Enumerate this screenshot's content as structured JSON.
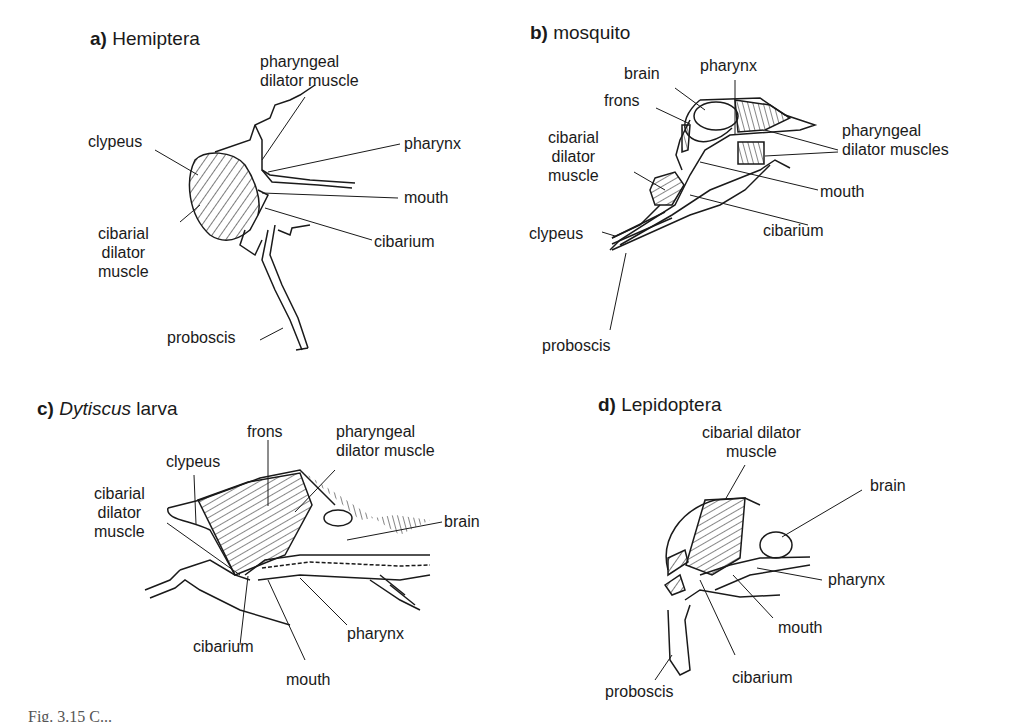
{
  "panels": {
    "a": {
      "letter": "a)",
      "title": "Hemiptera",
      "labels": {
        "pharyngeal_dilator_1": "pharyngeal",
        "pharyngeal_dilator_2": "dilator muscle",
        "clypeus": "clypeus",
        "pharynx": "pharynx",
        "mouth": "mouth",
        "cibarium": "cibarium",
        "cibarial_1": "cibarial",
        "cibarial_2": "dilator",
        "cibarial_3": "muscle",
        "proboscis": "proboscis"
      }
    },
    "b": {
      "letter": "b)",
      "title": "mosquito",
      "labels": {
        "brain": "brain",
        "pharynx": "pharynx",
        "frons": "frons",
        "pharyngeal_1": "pharyngeal",
        "pharyngeal_2": "dilator muscles",
        "cibarial_1": "cibarial",
        "cibarial_2": "dilator",
        "cibarial_3": "muscle",
        "mouth": "mouth",
        "clypeus": "clypeus",
        "cibarium": "cibarium",
        "proboscis": "proboscis"
      }
    },
    "c": {
      "letter": "c)",
      "title_italic": "Dytiscus",
      "title_rest": " larva",
      "labels": {
        "frons": "frons",
        "pharyngeal_1": "pharyngeal",
        "pharyngeal_2": "dilator muscle",
        "clypeus": "clypeus",
        "cibarial_1": "cibarial",
        "cibarial_2": "dilator",
        "cibarial_3": "muscle",
        "brain": "brain",
        "cibarium": "cibarium",
        "pharynx": "pharynx",
        "mouth": "mouth"
      }
    },
    "d": {
      "letter": "d)",
      "title": "Lepidoptera",
      "labels": {
        "cibarial_1": "cibarial dilator",
        "cibarial_2": "muscle",
        "brain": "brain",
        "pharynx": "pharynx",
        "mouth": "mouth",
        "cibarium": "cibarium",
        "proboscis": "proboscis"
      }
    }
  },
  "caption": "Fig. 3.15  C..."
}
